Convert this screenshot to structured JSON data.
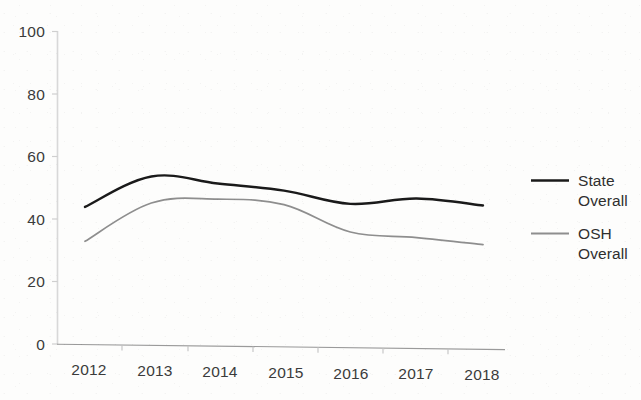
{
  "chart_data": {
    "type": "line",
    "title": "",
    "subtitle": "",
    "xlabel": "",
    "ylabel": "",
    "categories": [
      "2012",
      "2013",
      "2014",
      "2015",
      "2016",
      "2017",
      "2018"
    ],
    "x_tick_labels": [
      "2012",
      "2013",
      "2014",
      "2015",
      "2016",
      "2017",
      "2018"
    ],
    "y_tick_labels": [
      "0",
      "20",
      "40",
      "60",
      "80",
      "100"
    ],
    "y_ticks": [
      0,
      20,
      40,
      60,
      80,
      100
    ],
    "ylim": [
      0,
      100
    ],
    "grid": false,
    "legend_position": "right",
    "series": [
      {
        "name": "State Overall",
        "legend_label_line1": "State",
        "legend_label_line2": "Overall",
        "color": "#1a1a1a",
        "line_width": 2.4,
        "values": [
          44,
          54,
          52,
          50,
          46,
          48,
          46
        ]
      },
      {
        "name": "OSH Overall",
        "legend_label_line1": "OSH",
        "legend_label_line2": "Overall",
        "color": "#8e8e8e",
        "line_width": 1.7,
        "values": [
          33,
          45.5,
          47,
          45.5,
          37,
          35.5,
          33.5
        ]
      }
    ],
    "annotations": []
  },
  "axes": {
    "y_axis_color": "#d6d6d6",
    "x_axis_color": "#8f8f8f",
    "tick_color": "#c9c9c9"
  },
  "legend": {
    "entries": [
      {
        "label": "State Overall",
        "line1": "State",
        "line2": "Overall",
        "swatch": "state-overall-swatch"
      },
      {
        "label": "OSH Overall",
        "line1": "OSH",
        "line2": "Overall",
        "swatch": "osh-overall-swatch"
      }
    ]
  }
}
